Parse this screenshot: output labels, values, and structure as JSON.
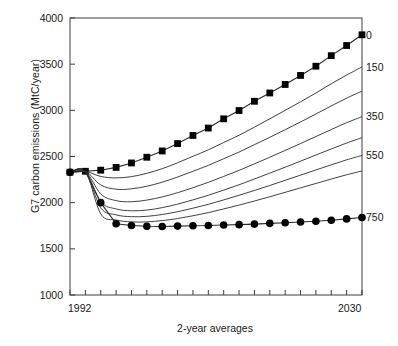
{
  "chart_data": {
    "type": "line",
    "title": "",
    "xlabel": "2-year averages",
    "ylabel": "G7 carbon emissions (MtC/year)",
    "xlim": [
      1992,
      2030
    ],
    "ylim": [
      1000,
      4000
    ],
    "yticks": [
      1000,
      1500,
      2000,
      2500,
      3000,
      3500,
      4000
    ],
    "ytick_labels": [
      "1000",
      "1500",
      "2000",
      "2500",
      "3000",
      "3500",
      "4000"
    ],
    "xtick_labels": [
      "1992",
      "2030"
    ],
    "xtick_count": 20,
    "grid": false,
    "legend_position": "right-inline",
    "x": [
      1992,
      1994,
      1996,
      1998,
      2000,
      2002,
      2004,
      2006,
      2008,
      2010,
      2012,
      2014,
      2016,
      2018,
      2020,
      2022,
      2024,
      2026,
      2028,
      2030
    ],
    "series": [
      {
        "name": "0",
        "label": "0",
        "marker": "square",
        "values": [
          2330,
          2340,
          2352,
          2382,
          2430,
          2492,
          2560,
          2640,
          2728,
          2808,
          2908,
          2998,
          3098,
          3188,
          3280,
          3378,
          3478,
          3592,
          3702,
          3818
        ]
      },
      {
        "name": "150",
        "label": "150",
        "marker": "none",
        "values": [
          2330,
          2340,
          2284,
          2268,
          2282,
          2318,
          2368,
          2432,
          2502,
          2572,
          2652,
          2730,
          2818,
          2908,
          3000,
          3092,
          3188,
          3288,
          3382,
          3470
        ]
      },
      {
        "name": "250",
        "label": "",
        "marker": "none",
        "values": [
          2330,
          2340,
          2192,
          2146,
          2150,
          2178,
          2222,
          2278,
          2340,
          2404,
          2476,
          2548,
          2628,
          2708,
          2790,
          2874,
          2960,
          3048,
          3132,
          3208
        ]
      },
      {
        "name": "350",
        "label": "350",
        "marker": "none",
        "values": [
          2330,
          2340,
          2094,
          2022,
          2010,
          2028,
          2062,
          2108,
          2162,
          2220,
          2284,
          2350,
          2420,
          2492,
          2566,
          2640,
          2716,
          2792,
          2866,
          2932
        ]
      },
      {
        "name": "450",
        "label": "",
        "marker": "none",
        "values": [
          2330,
          2340,
          2010,
          1932,
          1912,
          1920,
          1946,
          1984,
          2030,
          2080,
          2136,
          2194,
          2256,
          2320,
          2384,
          2450,
          2516,
          2582,
          2646,
          2704
        ]
      },
      {
        "name": "550",
        "label": "550",
        "marker": "none",
        "values": [
          2330,
          2340,
          1944,
          1868,
          1848,
          1852,
          1872,
          1902,
          1940,
          1982,
          2030,
          2080,
          2132,
          2186,
          2242,
          2298,
          2354,
          2410,
          2464,
          2512
        ]
      },
      {
        "name": "650",
        "label": "",
        "marker": "none",
        "values": [
          2330,
          2340,
          1878,
          1812,
          1792,
          1792,
          1806,
          1828,
          1858,
          1892,
          1932,
          1974,
          2018,
          2064,
          2112,
          2160,
          2208,
          2256,
          2302,
          2344
        ]
      },
      {
        "name": "750",
        "label": "750",
        "marker": "circle",
        "values": [
          2330,
          2340,
          2000,
          1772,
          1752,
          1744,
          1742,
          1746,
          1750,
          1752,
          1758,
          1762,
          1768,
          1776,
          1782,
          1790,
          1798,
          1810,
          1824,
          1840
        ]
      }
    ],
    "annotations": []
  },
  "colors": {
    "axis": "#3d3d3d",
    "line": "#2b2b2b",
    "marker": "#000000",
    "background": "#ffffff",
    "text": "#1a1a1a"
  }
}
